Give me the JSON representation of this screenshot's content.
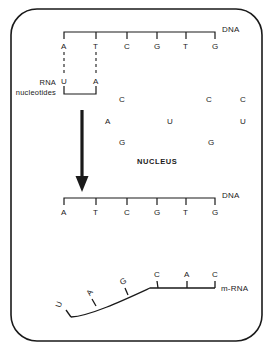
{
  "diagram": {
    "title_labels": {
      "dna_top": "DNA",
      "dna_bottom": "DNA",
      "mrna": "m-RNA",
      "nucleus": "NUCLEUS",
      "rna_nucleotides_line1": "RNA",
      "rna_nucleotides_line2": "nucleotides"
    },
    "colors": {
      "ink": "#1a1a1a",
      "background": "#ffffff"
    },
    "dna_top_strand": {
      "label": "DNA",
      "bases": [
        {
          "base": "A",
          "x": 64,
          "y": 47
        },
        {
          "base": "T",
          "x": 96,
          "y": 47
        },
        {
          "base": "C",
          "x": 127,
          "y": 47
        },
        {
          "base": "G",
          "x": 157,
          "y": 47
        },
        {
          "base": "T",
          "x": 186,
          "y": 47
        },
        {
          "base": "G",
          "x": 215,
          "y": 47
        }
      ]
    },
    "paired_rna_nucleotides": {
      "label_line1": "RNA",
      "label_line2": "nucleotides",
      "bases": [
        {
          "base": "U",
          "x": 64,
          "y": 82,
          "pairs_with": "A"
        },
        {
          "base": "A",
          "x": 96,
          "y": 82,
          "pairs_with": "T"
        }
      ]
    },
    "free_nucleotides": [
      {
        "base": "C",
        "x": 122,
        "y": 100
      },
      {
        "base": "C",
        "x": 209,
        "y": 100
      },
      {
        "base": "C",
        "x": 243,
        "y": 100
      },
      {
        "base": "A",
        "x": 108,
        "y": 122
      },
      {
        "base": "U",
        "x": 170,
        "y": 122
      },
      {
        "base": "U",
        "x": 243,
        "y": 122
      },
      {
        "base": "G",
        "x": 122,
        "y": 143
      },
      {
        "base": "G",
        "x": 211,
        "y": 143
      }
    ],
    "nucleus_label": "NUCLEUS",
    "arrow": {
      "name": "downward-transcription-arrow",
      "x": 82,
      "y_start": 110,
      "y_end": 190
    },
    "dna_bottom_strand": {
      "label": "DNA",
      "bases": [
        {
          "base": "A",
          "x": 64,
          "y": 213
        },
        {
          "base": "T",
          "x": 96,
          "y": 213
        },
        {
          "base": "C",
          "x": 127,
          "y": 213
        },
        {
          "base": "G",
          "x": 157,
          "y": 213
        },
        {
          "base": "T",
          "x": 186,
          "y": 213
        },
        {
          "base": "G",
          "x": 215,
          "y": 213
        }
      ]
    },
    "mrna_strand": {
      "label": "m-RNA",
      "bases": [
        {
          "base": "U",
          "rotated": true
        },
        {
          "base": "A",
          "rotated": true
        },
        {
          "base": "G",
          "rotated": true
        },
        {
          "base": "C",
          "rotated": false
        },
        {
          "base": "A",
          "rotated": false
        },
        {
          "base": "C",
          "rotated": false
        }
      ]
    }
  }
}
